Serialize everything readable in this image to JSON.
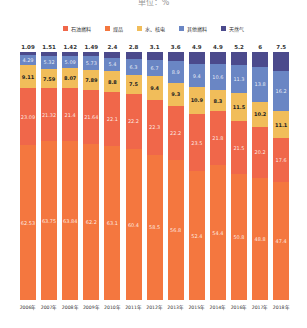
{
  "title": "单位：%",
  "legend": [
    {
      "label": "石油燃料",
      "color": "#f0674a"
    },
    {
      "label": "煤品",
      "color": "#f4773f"
    },
    {
      "label": "水、核电",
      "color": "#f1bd5a"
    },
    {
      "label": "其他燃料",
      "color": "#6a86c4"
    },
    {
      "label": "天然气",
      "color": "#4b4a8c"
    }
  ],
  "chart_data": {
    "type": "bar",
    "stacked": true,
    "title": "单位：%",
    "xlabel": "",
    "ylabel": "",
    "ylim": [
      0,
      100
    ],
    "grid": false,
    "legend_position": "top",
    "categories": [
      "2006年",
      "2007年",
      "2008年",
      "2009年",
      "2010年",
      "2011年",
      "2012年",
      "2013年",
      "2015年",
      "2014年",
      "2016年",
      "2017年",
      "2018年"
    ],
    "series": [
      {
        "name": "煤品",
        "color": "#f4773f",
        "values": [
          62.53,
          63.75,
          63.84,
          62.2,
          63.1,
          60.4,
          58.5,
          56.8,
          52.4,
          54.4,
          50.8,
          48.8,
          47.4
        ]
      },
      {
        "name": "石油燃料",
        "color": "#f0674a",
        "values": [
          23.09,
          21.32,
          21.4,
          21.64,
          22.1,
          22.2,
          22.3,
          22.2,
          23.5,
          21.8,
          21.5,
          20.2,
          17.6
        ]
      },
      {
        "name": "水、核电",
        "color": "#f1bd5a",
        "values": [
          9.11,
          7.59,
          8.07,
          7.89,
          8.8,
          7.5,
          9.4,
          9.3,
          10.9,
          8.3,
          11.5,
          10.2,
          11.1
        ]
      },
      {
        "name": "其他燃料",
        "color": "#6a86c4",
        "values": [
          4.29,
          5.32,
          5.09,
          5.73,
          5.4,
          6.3,
          6.7,
          8.9,
          9.4,
          10.6,
          11.3,
          13.8,
          16.2
        ]
      },
      {
        "name": "天然气",
        "color": "#4b4a8c",
        "values": [
          1.09,
          1.51,
          1.42,
          1.49,
          2.4,
          2.8,
          3.1,
          3.6,
          4.9,
          4.9,
          5.2,
          6.0,
          7.5
        ]
      }
    ],
    "top_labels": [
      "1.09",
      "1.51",
      "1.42",
      "1.49",
      "2.4",
      "2.8",
      "3.1",
      "3.6",
      "4.9",
      "4.9",
      "5.2",
      "6",
      "7.5"
    ]
  }
}
